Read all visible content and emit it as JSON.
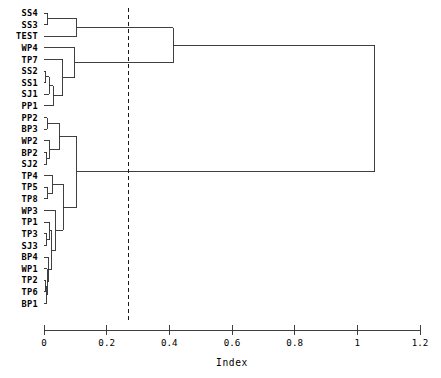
{
  "chart_data": {
    "type": "dendrogram",
    "title": "",
    "xlabel": "Index",
    "ylabel": "",
    "xlim": [
      0,
      1.2
    ],
    "grid": false,
    "orientation": "horizontal",
    "legend": "none",
    "xticks": [
      {
        "value": 0,
        "label": "0"
      },
      {
        "value": 0.2,
        "label": "0.2"
      },
      {
        "value": 0.4,
        "label": "0.4"
      },
      {
        "value": 0.6,
        "label": "0.6"
      },
      {
        "value": 0.8,
        "label": "0.8"
      },
      {
        "value": 1.0,
        "label": "1"
      },
      {
        "value": 1.2,
        "label": "1.2"
      }
    ],
    "cut_line": {
      "value": 0.27,
      "style": "dashed"
    },
    "leaves": [
      "SS4",
      "SS3",
      "TEST",
      "WP4",
      "TP7",
      "SS2",
      "SS1",
      "SJ1",
      "PP1",
      "PP2",
      "BP3",
      "WP2",
      "BP2",
      "SJ2",
      "TP4",
      "TP5",
      "TP8",
      "WP3",
      "TP1",
      "TP3",
      "SJ3",
      "BP4",
      "WP1",
      "TP2",
      "TP6",
      "BP1"
    ],
    "merges": [
      {
        "id": "m1",
        "left": "SS4",
        "right": "SS3",
        "height": 0.012
      },
      {
        "id": "m2",
        "left": "m1",
        "right": "TEST",
        "height": 0.105
      },
      {
        "id": "m3",
        "left": "SS2",
        "right": "SS1",
        "height": 0.006
      },
      {
        "id": "m4",
        "left": "m3",
        "right": "SJ1",
        "height": 0.016
      },
      {
        "id": "m5",
        "left": "m4",
        "right": "PP1",
        "height": 0.03
      },
      {
        "id": "m6",
        "left": "TP7",
        "right": "m5",
        "height": 0.06
      },
      {
        "id": "m7",
        "left": "WP4",
        "right": "m6",
        "height": 0.098
      },
      {
        "id": "m8",
        "left": "m2",
        "right": "m7",
        "height": 0.412
      },
      {
        "id": "m9",
        "left": "PP2",
        "right": "BP3",
        "height": 0.01
      },
      {
        "id": "m10",
        "left": "BP2",
        "right": "SJ2",
        "height": 0.008
      },
      {
        "id": "m11",
        "left": "WP2",
        "right": "m10",
        "height": 0.018
      },
      {
        "id": "m12",
        "left": "m9",
        "right": "m11",
        "height": 0.048
      },
      {
        "id": "m13",
        "left": "TP5",
        "right": "TP8",
        "height": 0.012
      },
      {
        "id": "m14",
        "left": "TP4",
        "right": "m13",
        "height": 0.028
      },
      {
        "id": "m15",
        "left": "TP3",
        "right": "SJ3",
        "height": 0.008
      },
      {
        "id": "m16",
        "left": "TP1",
        "right": "m15",
        "height": 0.018
      },
      {
        "id": "m17",
        "left": "TP2",
        "right": "TP6",
        "height": 0.004
      },
      {
        "id": "m18",
        "left": "m17",
        "right": "BP1",
        "height": 0.007
      },
      {
        "id": "m19",
        "left": "WP1",
        "right": "m18",
        "height": 0.01
      },
      {
        "id": "m20",
        "left": "BP4",
        "right": "m19",
        "height": 0.014
      },
      {
        "id": "m21",
        "left": "m16",
        "right": "m20",
        "height": 0.025
      },
      {
        "id": "m22",
        "left": "WP3",
        "right": "m21",
        "height": 0.038
      },
      {
        "id": "m23",
        "left": "m14",
        "right": "m22",
        "height": 0.062
      },
      {
        "id": "m24",
        "left": "m12",
        "right": "m23",
        "height": 0.105
      },
      {
        "id": "m25",
        "left": "m8",
        "right": "m24",
        "height": 1.055
      }
    ]
  },
  "axis": {
    "title": "Index"
  }
}
